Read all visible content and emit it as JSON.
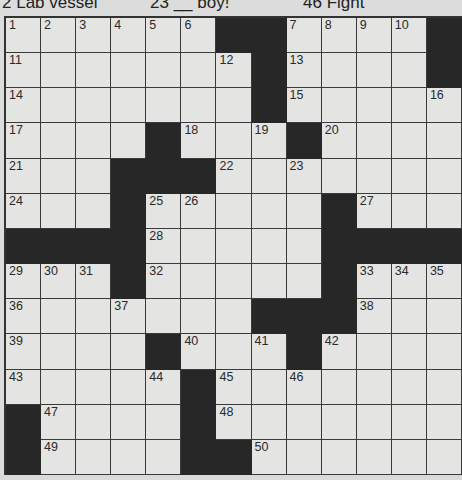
{
  "top_clues_partial": [
    {
      "label": "2 Lab vessel",
      "x": 2
    },
    {
      "label": "23 __ boy!",
      "x": 150
    },
    {
      "label": "46 Fight",
      "x": 303
    }
  ],
  "puzzle": {
    "rows": 13,
    "cols": 13,
    "layout": [
      [
        "1",
        "2",
        "3",
        "4",
        "5",
        "6",
        "#",
        "#",
        "7",
        "8",
        "9",
        "10",
        "#"
      ],
      [
        "11",
        "",
        "",
        "",
        "",
        "",
        "12",
        "#",
        "13",
        "",
        "",
        "",
        "#"
      ],
      [
        "14",
        "",
        "",
        "",
        "",
        "",
        "",
        "#",
        "15",
        "",
        "",
        "",
        "16"
      ],
      [
        "17",
        "",
        "",
        "",
        "#",
        "18",
        "",
        "19",
        "#",
        "20",
        "",
        "",
        ""
      ],
      [
        "21",
        "",
        "",
        "#",
        "#",
        "#",
        "22",
        "",
        "23",
        "",
        "",
        "",
        ""
      ],
      [
        "24",
        "",
        "",
        "#",
        "25",
        "26",
        "",
        "",
        "",
        "#",
        "27",
        "",
        ""
      ],
      [
        "#",
        "#",
        "#",
        "#",
        "28",
        "",
        "",
        "",
        "",
        "#",
        "#",
        "#",
        "#"
      ],
      [
        "29",
        "30",
        "31",
        "#",
        "32",
        "",
        "",
        "",
        "",
        "#",
        "33",
        "34",
        "35"
      ],
      [
        "36",
        "",
        "",
        "37",
        "",
        "",
        "",
        "#",
        "#",
        "#",
        "38",
        "",
        ""
      ],
      [
        "39",
        "",
        "",
        "",
        "#",
        "40",
        "",
        "41",
        "#",
        "42",
        "",
        "",
        ""
      ],
      [
        "43",
        "",
        "",
        "",
        "44",
        "#",
        "45",
        "",
        "46",
        "",
        "",
        "",
        ""
      ],
      [
        "#",
        "47",
        "",
        "",
        "",
        "#",
        "48",
        "",
        "",
        "",
        "",
        "",
        ""
      ],
      [
        "#",
        "49",
        "",
        "",
        "",
        "#",
        "#",
        "50",
        "",
        "",
        "",
        "",
        ""
      ]
    ]
  }
}
